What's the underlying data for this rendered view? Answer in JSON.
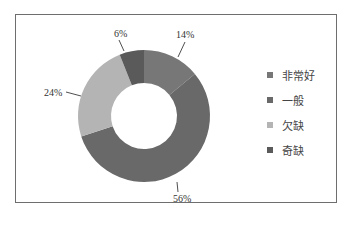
{
  "chart_data": {
    "type": "pie",
    "variant": "donut",
    "title": "",
    "categories": [
      "非常好",
      "一般",
      "欠缺",
      "奇缺"
    ],
    "values": [
      14,
      56,
      24,
      6
    ],
    "value_labels": [
      "14%",
      "56%",
      "24%",
      "6%"
    ],
    "colors": [
      "#777777",
      "#696969",
      "#b4b4b4",
      "#5a5a5a"
    ],
    "start_angle": "12 o'clock",
    "direction": "clockwise",
    "legend_position": "right",
    "grid": false
  },
  "legend": {
    "items": [
      {
        "label": "非常好",
        "color": "#777777"
      },
      {
        "label": "一般",
        "color": "#696969"
      },
      {
        "label": "欠缺",
        "color": "#b4b4b4"
      },
      {
        "label": "奇缺",
        "color": "#5a5a5a"
      }
    ]
  },
  "labels": {
    "very_good": "14%",
    "average": "56%",
    "lacking": "24%",
    "severely_lacking": "6%"
  }
}
